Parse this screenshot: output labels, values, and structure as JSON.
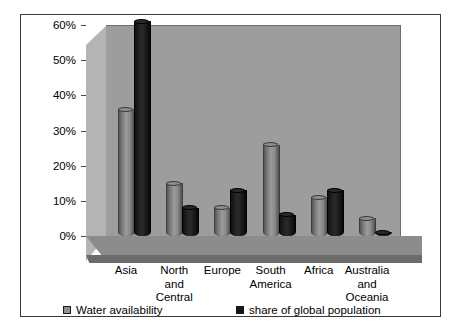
{
  "chart_data": {
    "type": "bar",
    "title": "",
    "subtitle": "",
    "xlabel": "",
    "ylabel": "",
    "categories": [
      "Asia",
      "North and Central",
      "Europe",
      "South America",
      "Africa",
      "Australia and Oceania"
    ],
    "category_lines": [
      [
        "Asia"
      ],
      [
        "North",
        "and",
        "Central"
      ],
      [
        "Europe"
      ],
      [
        "South",
        "America"
      ],
      [
        "Africa"
      ],
      [
        "Australia",
        "and",
        "Oceania"
      ]
    ],
    "series": [
      {
        "name": "Water availability",
        "color": "#8f8f8f",
        "values": [
          36,
          15,
          8,
          26,
          11,
          5
        ]
      },
      {
        "name": "share of global population",
        "color": "#161616",
        "values": [
          61,
          8,
          13,
          6,
          13,
          1
        ]
      }
    ],
    "ylim": [
      0,
      60
    ],
    "ytick_values": [
      0,
      10,
      20,
      30,
      40,
      50,
      60
    ],
    "ytick_labels": [
      "0%",
      "10%",
      "20%",
      "30%",
      "40%",
      "50%",
      "60%"
    ],
    "grid": false,
    "legend_position": "bottom",
    "value_suffix": "%",
    "style": "3d-cylinder"
  },
  "legend": {
    "items": [
      {
        "label": "Water availability",
        "swatch": "water"
      },
      {
        "label": "share of global population",
        "swatch": "pop"
      }
    ]
  },
  "colors": {
    "back_wall": "#9d9d9d",
    "left_wall": "#b4b4b4",
    "floor": "#8c8c8c",
    "frame_border": "#3a3a3a",
    "page_background": "#ffffff",
    "series_water": "#8f8f8f",
    "series_population": "#161616"
  }
}
